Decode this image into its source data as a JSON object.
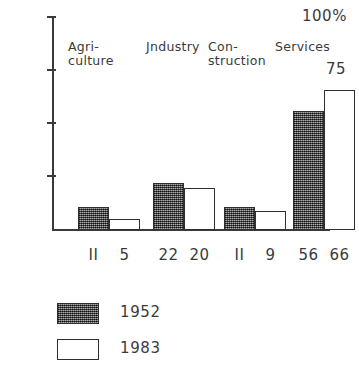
{
  "chart_data": {
    "type": "bar",
    "title": "",
    "xlabel": "",
    "ylabel": "100%",
    "ylim": [
      0,
      100
    ],
    "grid": false,
    "legend_position": "bottom-left",
    "categories": [
      "Agri-\nculture",
      "Jndustry",
      "Con-\nstruction",
      "Services"
    ],
    "series": [
      {
        "name": "1952",
        "values": [
          11,
          22,
          11,
          56
        ]
      },
      {
        "name": "1983",
        "values": [
          5,
          20,
          9,
          66
        ]
      }
    ],
    "y_ticks": [
      {
        "value": 100,
        "label": "100%"
      },
      {
        "value": 75,
        "label": "75"
      },
      {
        "value": 50,
        "label": "50"
      },
      {
        "value": 25,
        "label": "25"
      }
    ],
    "value_labels": [
      {
        "label": "II"
      },
      {
        "label": "5"
      },
      {
        "label": "22"
      },
      {
        "label": "20"
      },
      {
        "label": "II"
      },
      {
        "label": "9"
      },
      {
        "label": "56"
      },
      {
        "label": "66"
      }
    ],
    "legend": [
      {
        "label": "1952",
        "style": "hatched",
        "color": "#575757"
      },
      {
        "label": "1983",
        "style": "outline",
        "color": "#ffffff"
      }
    ],
    "colors": {
      "axis": "#3a3a3a",
      "series_1952": "#575757",
      "series_1983": "#ffffff",
      "outline": "#2f2f2f",
      "background": "#ffffff"
    }
  }
}
